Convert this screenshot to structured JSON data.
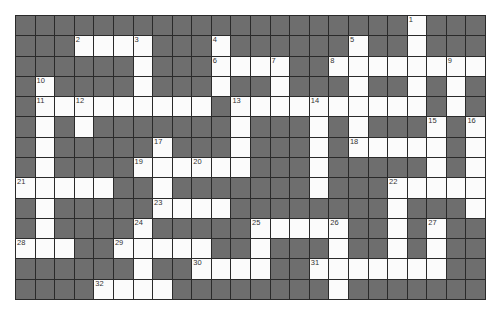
{
  "puzzle": {
    "rows": 14,
    "cols": 24,
    "colors": {
      "block": "#6e6e6e",
      "open": "#fbfbfb",
      "grid_line": "#2a2a2a"
    },
    "white_cells": [
      [
        0,
        20
      ],
      [
        1,
        3
      ],
      [
        1,
        4
      ],
      [
        1,
        5
      ],
      [
        1,
        6
      ],
      [
        1,
        10
      ],
      [
        1,
        17
      ],
      [
        1,
        20
      ],
      [
        2,
        6
      ],
      [
        2,
        10
      ],
      [
        2,
        11
      ],
      [
        2,
        12
      ],
      [
        2,
        13
      ],
      [
        2,
        16
      ],
      [
        2,
        17
      ],
      [
        2,
        18
      ],
      [
        2,
        19
      ],
      [
        2,
        20
      ],
      [
        2,
        21
      ],
      [
        2,
        22
      ],
      [
        2,
        23
      ],
      [
        3,
        1
      ],
      [
        3,
        6
      ],
      [
        3,
        10
      ],
      [
        3,
        13
      ],
      [
        3,
        17
      ],
      [
        3,
        20
      ],
      [
        3,
        22
      ],
      [
        4,
        1
      ],
      [
        4,
        2
      ],
      [
        4,
        3
      ],
      [
        4,
        4
      ],
      [
        4,
        5
      ],
      [
        4,
        6
      ],
      [
        4,
        7
      ],
      [
        4,
        8
      ],
      [
        4,
        9
      ],
      [
        4,
        11
      ],
      [
        4,
        12
      ],
      [
        4,
        13
      ],
      [
        4,
        14
      ],
      [
        4,
        15
      ],
      [
        4,
        16
      ],
      [
        4,
        17
      ],
      [
        4,
        18
      ],
      [
        4,
        19
      ],
      [
        4,
        20
      ],
      [
        4,
        22
      ],
      [
        5,
        1
      ],
      [
        5,
        3
      ],
      [
        5,
        11
      ],
      [
        5,
        15
      ],
      [
        5,
        17
      ],
      [
        5,
        21
      ],
      [
        5,
        23
      ],
      [
        6,
        1
      ],
      [
        6,
        7
      ],
      [
        6,
        11
      ],
      [
        6,
        15
      ],
      [
        6,
        17
      ],
      [
        6,
        18
      ],
      [
        6,
        19
      ],
      [
        6,
        20
      ],
      [
        6,
        21
      ],
      [
        6,
        23
      ],
      [
        7,
        1
      ],
      [
        7,
        6
      ],
      [
        7,
        7
      ],
      [
        7,
        8
      ],
      [
        7,
        9
      ],
      [
        7,
        10
      ],
      [
        7,
        11
      ],
      [
        7,
        15
      ],
      [
        7,
        21
      ],
      [
        7,
        23
      ],
      [
        8,
        0
      ],
      [
        8,
        1
      ],
      [
        8,
        2
      ],
      [
        8,
        3
      ],
      [
        8,
        4
      ],
      [
        8,
        7
      ],
      [
        8,
        15
      ],
      [
        8,
        19
      ],
      [
        8,
        20
      ],
      [
        8,
        21
      ],
      [
        8,
        22
      ],
      [
        8,
        23
      ],
      [
        9,
        1
      ],
      [
        9,
        7
      ],
      [
        9,
        8
      ],
      [
        9,
        9
      ],
      [
        9,
        10
      ],
      [
        9,
        19
      ],
      [
        9,
        23
      ],
      [
        10,
        1
      ],
      [
        10,
        6
      ],
      [
        10,
        12
      ],
      [
        10,
        13
      ],
      [
        10,
        14
      ],
      [
        10,
        15
      ],
      [
        10,
        16
      ],
      [
        10,
        19
      ],
      [
        10,
        21
      ],
      [
        11,
        0
      ],
      [
        11,
        1
      ],
      [
        11,
        2
      ],
      [
        11,
        5
      ],
      [
        11,
        6
      ],
      [
        11,
        7
      ],
      [
        11,
        8
      ],
      [
        11,
        9
      ],
      [
        11,
        12
      ],
      [
        11,
        16
      ],
      [
        11,
        19
      ],
      [
        11,
        21
      ],
      [
        12,
        6
      ],
      [
        12,
        9
      ],
      [
        12,
        10
      ],
      [
        12,
        11
      ],
      [
        12,
        12
      ],
      [
        12,
        15
      ],
      [
        12,
        16
      ],
      [
        12,
        17
      ],
      [
        12,
        18
      ],
      [
        12,
        19
      ],
      [
        12,
        20
      ],
      [
        12,
        21
      ],
      [
        13,
        4
      ],
      [
        13,
        5
      ],
      [
        13,
        6
      ],
      [
        13,
        7
      ],
      [
        13,
        16
      ]
    ],
    "clue_numbers": [
      {
        "n": "1",
        "r": 0,
        "c": 20
      },
      {
        "n": "2",
        "r": 1,
        "c": 3
      },
      {
        "n": "3",
        "r": 1,
        "c": 6
      },
      {
        "n": "4",
        "r": 1,
        "c": 10
      },
      {
        "n": "5",
        "r": 1,
        "c": 17
      },
      {
        "n": "6",
        "r": 2,
        "c": 10
      },
      {
        "n": "7",
        "r": 2,
        "c": 13
      },
      {
        "n": "8",
        "r": 2,
        "c": 16
      },
      {
        "n": "9",
        "r": 2,
        "c": 22
      },
      {
        "n": "10",
        "r": 3,
        "c": 1
      },
      {
        "n": "11",
        "r": 4,
        "c": 1
      },
      {
        "n": "12",
        "r": 4,
        "c": 3
      },
      {
        "n": "13",
        "r": 4,
        "c": 11
      },
      {
        "n": "14",
        "r": 4,
        "c": 15
      },
      {
        "n": "15",
        "r": 5,
        "c": 21
      },
      {
        "n": "16",
        "r": 5,
        "c": 23
      },
      {
        "n": "17",
        "r": 6,
        "c": 7
      },
      {
        "n": "18",
        "r": 6,
        "c": 17
      },
      {
        "n": "19",
        "r": 7,
        "c": 6
      },
      {
        "n": "20",
        "r": 7,
        "c": 9
      },
      {
        "n": "21",
        "r": 8,
        "c": 0
      },
      {
        "n": "22",
        "r": 8,
        "c": 19
      },
      {
        "n": "23",
        "r": 9,
        "c": 7
      },
      {
        "n": "24",
        "r": 10,
        "c": 6
      },
      {
        "n": "25",
        "r": 10,
        "c": 12
      },
      {
        "n": "26",
        "r": 10,
        "c": 16
      },
      {
        "n": "27",
        "r": 10,
        "c": 21
      },
      {
        "n": "28",
        "r": 11,
        "c": 0
      },
      {
        "n": "29",
        "r": 11,
        "c": 5
      },
      {
        "n": "30",
        "r": 12,
        "c": 9
      },
      {
        "n": "31",
        "r": 12,
        "c": 15
      },
      {
        "n": "32",
        "r": 13,
        "c": 4
      }
    ]
  }
}
